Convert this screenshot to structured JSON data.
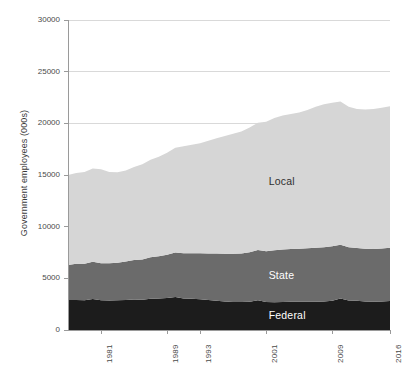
{
  "chart_data": {
    "type": "area",
    "stacked": true,
    "title": "",
    "xlabel": "",
    "ylabel": "Government employees (000s)",
    "ylim": [
      0,
      30000
    ],
    "xlim": [
      1977,
      2016
    ],
    "grid": true,
    "legend_position": "inline-on-bands",
    "ytick_labels": [
      "0",
      "5000",
      "10000",
      "15000",
      "20000",
      "25000",
      "30000"
    ],
    "ytick_values": [
      0,
      5000,
      10000,
      15000,
      20000,
      25000,
      30000
    ],
    "xtick_labels": [
      "1981",
      "1989",
      "1993",
      "2001",
      "2009",
      "2016"
    ],
    "xtick_values": [
      1981,
      1989,
      1993,
      2001,
      2009,
      2016
    ],
    "x": [
      1977,
      1978,
      1979,
      1980,
      1981,
      1982,
      1983,
      1984,
      1985,
      1986,
      1987,
      1988,
      1989,
      1990,
      1991,
      1992,
      1993,
      1994,
      1995,
      1996,
      1997,
      1998,
      1999,
      2000,
      2001,
      2002,
      2003,
      2004,
      2005,
      2006,
      2007,
      2008,
      2009,
      2010,
      2011,
      2012,
      2013,
      2014,
      2015,
      2016
    ],
    "series": [
      {
        "name": "Federal",
        "color": "#1c1c1c",
        "label_text": "Federal",
        "values": [
          2900,
          2900,
          2870,
          3000,
          2890,
          2860,
          2870,
          2900,
          2960,
          2930,
          3030,
          3050,
          3090,
          3190,
          3050,
          3020,
          2970,
          2910,
          2840,
          2760,
          2720,
          2710,
          2740,
          2880,
          2710,
          2680,
          2710,
          2730,
          2730,
          2730,
          2740,
          2760,
          2830,
          3040,
          2850,
          2820,
          2770,
          2730,
          2750,
          2800
        ]
      },
      {
        "name": "State",
        "color": "#6b6b6b",
        "label_text": "State",
        "values": [
          3400,
          3500,
          3550,
          3610,
          3570,
          3590,
          3650,
          3720,
          3810,
          3900,
          4000,
          4080,
          4190,
          4310,
          4370,
          4400,
          4450,
          4500,
          4560,
          4620,
          4670,
          4700,
          4780,
          4870,
          4900,
          5030,
          5090,
          5120,
          5130,
          5170,
          5210,
          5250,
          5270,
          5220,
          5150,
          5110,
          5090,
          5110,
          5140,
          5160
        ]
      },
      {
        "name": "Local",
        "color": "#d6d6d6",
        "label_text": "Local",
        "values": [
          8700,
          8800,
          8880,
          9020,
          9100,
          8830,
          8740,
          8810,
          9000,
          9220,
          9440,
          9640,
          9880,
          10130,
          10370,
          10500,
          10650,
          10900,
          11150,
          11400,
          11600,
          11800,
          12070,
          12300,
          12550,
          12800,
          12960,
          13050,
          13200,
          13400,
          13650,
          13830,
          13900,
          13850,
          13600,
          13450,
          13480,
          13540,
          13620,
          13700
        ]
      }
    ]
  },
  "series_labels": {
    "local": "Local",
    "state": "State",
    "federal": "Federal"
  },
  "colors": {
    "federal": "#1c1c1c",
    "state": "#6b6b6b",
    "local": "#d6d6d6",
    "gridline": "#d9d9d9",
    "axis_text": "#4a4a4a",
    "title_text": "#3a3a3a",
    "background": "#ffffff"
  }
}
